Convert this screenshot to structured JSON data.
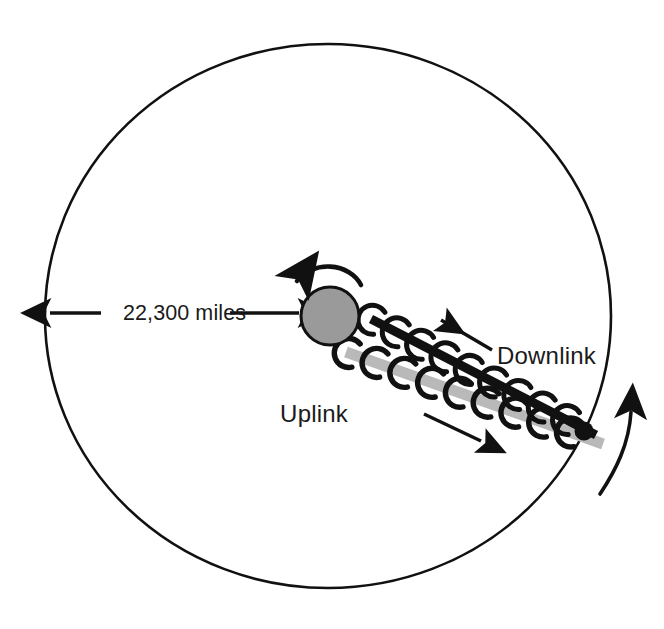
{
  "diagram": {
    "background_color": "#ffffff",
    "stroke_color": "#111111"
  },
  "orbit": {
    "name": "geostationary-orbit-path",
    "center_x": 328,
    "center_y": 316,
    "radius_x": 283,
    "radius_y": 272,
    "stroke_width": 2.6
  },
  "earth": {
    "name": "earth-body",
    "center_x": 330,
    "center_y": 316,
    "radius": 29,
    "fill_color": "#9a9a9a",
    "stroke_color": "#111111",
    "stroke_width": 3
  },
  "earth_rotation_arrow": {
    "name": "earth-rotation-arc",
    "direction": "counter-clockwise"
  },
  "orbit_direction_arrow": {
    "name": "orbit-direction-arc",
    "direction": "counter-clockwise"
  },
  "distance": {
    "label": "22,300 miles",
    "arrow_style": "double-headed",
    "from_x": 48,
    "to_x": 301,
    "y": 313
  },
  "downlink": {
    "label": "Downlink",
    "beam_color": "#111111",
    "label_x": 497,
    "label_y": 364,
    "arrow_direction": "up-left",
    "arrow_from_x": 492,
    "arrow_from_y": 350,
    "arrow_to_x": 441,
    "arrow_to_y": 320,
    "wave_count": 9
  },
  "uplink": {
    "label": "Uplink",
    "beam_color": "#b9b9b9",
    "label_x": 348,
    "label_y": 422,
    "arrow_direction": "down-right",
    "arrow_from_x": 424,
    "arrow_from_y": 414,
    "arrow_to_x": 481,
    "arrow_to_y": 441,
    "wave_count": 9
  },
  "ground_station": {
    "name": "ground-station-dot",
    "center_x": 584,
    "center_y": 431,
    "radius": 9.5,
    "fill_color": "#111111"
  }
}
